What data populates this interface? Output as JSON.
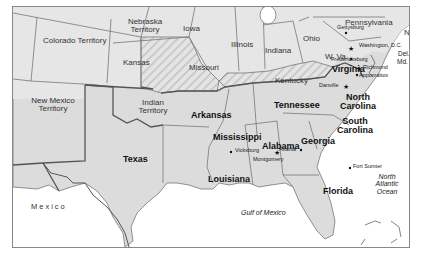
{
  "map": {
    "title": "",
    "colors": {
      "land": "#dcdcdc",
      "union_land": "#e6e6e6",
      "border_state": "#777777",
      "border_confed": "#555555",
      "water": "#ffffff",
      "hatch": "#c4c4c4"
    },
    "territories": [
      {
        "name": "Colorado Territory"
      },
      {
        "name": "Nebraska Territory"
      },
      {
        "name": "New Mexico Territory"
      },
      {
        "name": "Indian Territory"
      }
    ],
    "union_states": [
      {
        "name": "Kansas"
      },
      {
        "name": "Iowa"
      },
      {
        "name": "Illinois"
      },
      {
        "name": "Indiana"
      },
      {
        "name": "Ohio"
      },
      {
        "name": "Pennsylvania"
      },
      {
        "name": "N.J."
      },
      {
        "name": "W. Va."
      },
      {
        "name": "Del."
      },
      {
        "name": "Md."
      }
    ],
    "border_states_hatched": [
      {
        "name": "Missouri"
      },
      {
        "name": "Kentucky"
      }
    ],
    "confederate_states": [
      {
        "name": "Texas"
      },
      {
        "name": "Arkansas"
      },
      {
        "name": "Louisiana"
      },
      {
        "name": "Mississippi"
      },
      {
        "name": "Alabama"
      },
      {
        "name": "Tennessee"
      },
      {
        "name": "Georgia"
      },
      {
        "name": "Florida"
      },
      {
        "name": "South Carolina"
      },
      {
        "name": "North Carolina"
      },
      {
        "name": "Virginia"
      }
    ],
    "cities": [
      {
        "name": "Gettysburg",
        "symbol": "dot"
      },
      {
        "name": "Washington, D.C.",
        "symbol": "star"
      },
      {
        "name": "Fredericksburg",
        "symbol": "dot"
      },
      {
        "name": "Richmond",
        "symbol": "star"
      },
      {
        "name": "Appomattox",
        "symbol": "dot"
      },
      {
        "name": "Danville",
        "symbol": "star"
      },
      {
        "name": "Atlanta",
        "symbol": "dot"
      },
      {
        "name": "Fort Sumter",
        "symbol": "dot"
      },
      {
        "name": "Vicksburg",
        "symbol": "dot"
      },
      {
        "name": "Montgomery",
        "symbol": "star"
      }
    ],
    "water": [
      {
        "name": "Gulf of Mexico"
      },
      {
        "name": "North Atlantic Ocean"
      }
    ],
    "countries": [
      {
        "name": "Mexico"
      }
    ]
  }
}
